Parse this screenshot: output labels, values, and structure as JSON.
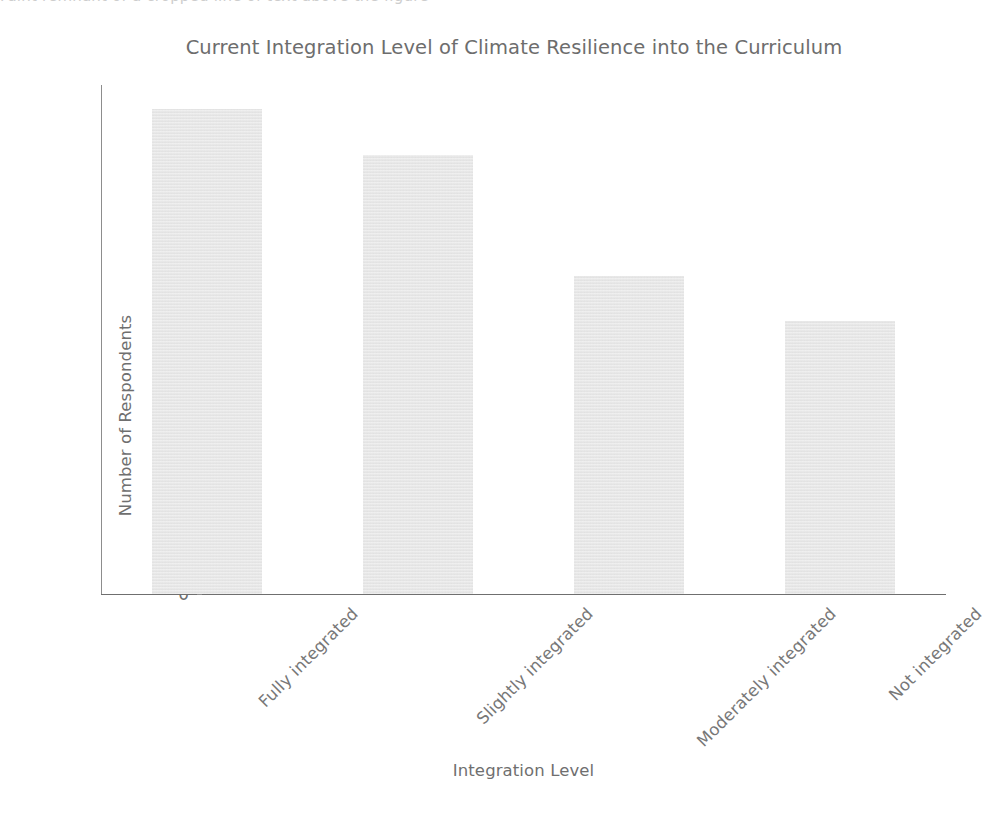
{
  "chart_data": {
    "type": "bar",
    "title": "Current Integration Level of Climate Resilience into the Curriculum",
    "xlabel": "Integration Level",
    "ylabel": "Number of Respondents",
    "categories": [
      "Fully integrated",
      "Slightly integrated",
      "Moderately integrated",
      "Not integrated"
    ],
    "values": [
      32,
      29,
      21,
      18
    ],
    "ylim": [
      0,
      33.6
    ],
    "yticks": [
      0,
      5,
      10,
      15,
      20,
      25,
      30
    ],
    "ytick_labels": [
      "0",
      "5",
      "10",
      "15",
      "20",
      "25",
      "30"
    ],
    "grid": false,
    "legend": null,
    "bar_color": "#e9e9e9",
    "axis_color": "#6f6f6f",
    "text_color": "#6f6f6f",
    "title_color": "#6d6d6d",
    "background": "#ffffff",
    "xtick_rotation": -45
  },
  "artifacts": {
    "top_cropped_text": "Faint remnant of a cropped line of text above the figure"
  }
}
